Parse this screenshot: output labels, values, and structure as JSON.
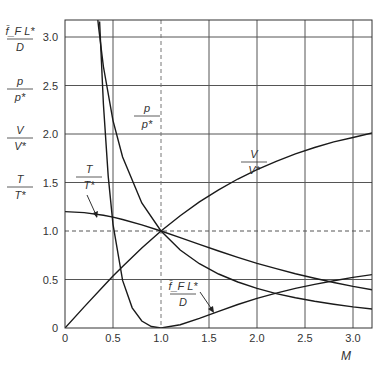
{
  "chart_data": {
    "type": "line",
    "title": "",
    "xlabel": "M",
    "ylabel": "",
    "xlim": [
      0,
      3.2
    ],
    "ylim": [
      0,
      3.18
    ],
    "grid": true,
    "x_ticks": [
      "0",
      "0.5",
      "1.0",
      "1.5",
      "2.0",
      "2.5",
      "3.0"
    ],
    "y_ticks": [
      "0",
      "0.5",
      "1.0",
      "1.5",
      "2.0",
      "2.5",
      "3.0"
    ],
    "y_axis_labels": [
      {
        "num": "f̄_F L*",
        "den": "D"
      },
      {
        "num": "p",
        "den": "p*"
      },
      {
        "num": "V",
        "den": "V*"
      },
      {
        "num": "T",
        "den": "T*"
      }
    ],
    "reference_lines": [
      {
        "type": "horizontal",
        "y": 1.0,
        "style": "dashed"
      },
      {
        "type": "vertical",
        "x": 1.0,
        "style": "dashed"
      }
    ],
    "series": [
      {
        "name": "T/T*",
        "label_num": "T",
        "label_den": "T*",
        "x": [
          0,
          0.2,
          0.4,
          0.5,
          0.6,
          0.8,
          1.0,
          1.2,
          1.4,
          1.6,
          1.8,
          2.0,
          2.2,
          2.4,
          2.6,
          2.8,
          3.0,
          3.2
        ],
        "values": [
          1.2,
          1.19,
          1.163,
          1.143,
          1.119,
          1.064,
          1.0,
          0.932,
          0.862,
          0.794,
          0.729,
          0.667,
          0.611,
          0.559,
          0.512,
          0.469,
          0.429,
          0.395
        ]
      },
      {
        "name": "p/p*",
        "label_num": "p",
        "label_den": "p*",
        "x": [
          0.32,
          0.35,
          0.4,
          0.5,
          0.6,
          0.8,
          1.0,
          1.2,
          1.4,
          1.6,
          1.8,
          2.0,
          2.2,
          2.4,
          2.6,
          2.8,
          3.0,
          3.2
        ],
        "values": [
          3.39,
          3.1,
          2.696,
          2.138,
          1.763,
          1.289,
          1.0,
          0.804,
          0.663,
          0.557,
          0.474,
          0.408,
          0.355,
          0.312,
          0.275,
          0.245,
          0.218,
          0.196
        ]
      },
      {
        "name": "V/V*",
        "label_num": "V",
        "label_den": "V*",
        "x": [
          0,
          0.2,
          0.4,
          0.5,
          0.6,
          0.8,
          1.0,
          1.2,
          1.4,
          1.6,
          1.8,
          2.0,
          2.2,
          2.4,
          2.6,
          2.8,
          3.0,
          3.2
        ],
        "values": [
          0,
          0.218,
          0.431,
          0.535,
          0.635,
          0.825,
          1.0,
          1.158,
          1.3,
          1.425,
          1.536,
          1.633,
          1.719,
          1.795,
          1.861,
          1.919,
          1.964,
          2.01
        ]
      },
      {
        "name": "f̄_F L*/D",
        "label_num": "f̄_F L*",
        "label_den": "D",
        "x": [
          0.36,
          0.4,
          0.45,
          0.5,
          0.6,
          0.7,
          0.8,
          0.9,
          1.0,
          1.2,
          1.4,
          1.6,
          1.8,
          2.0,
          2.2,
          2.4,
          2.6,
          2.8,
          3.0,
          3.2
        ],
        "values": [
          3.16,
          2.309,
          1.566,
          1.069,
          0.491,
          0.208,
          0.072,
          0.015,
          0,
          0.034,
          0.1,
          0.172,
          0.242,
          0.305,
          0.36,
          0.408,
          0.45,
          0.487,
          0.522,
          0.55
        ]
      }
    ]
  }
}
